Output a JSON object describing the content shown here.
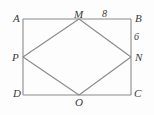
{
  "figure": {
    "kind": "geometry-diagram",
    "background_color": "#fdfdfd",
    "stroke_color": "#8a8a8a",
    "label_color": "#3a3a3a",
    "rectangle": {
      "name": "ABCD",
      "corners": [
        {
          "label": "A",
          "x": 23,
          "y": 19,
          "position": "top-left"
        },
        {
          "label": "B",
          "x": 131,
          "y": 19,
          "position": "top-right"
        },
        {
          "label": "C",
          "x": 131,
          "y": 95,
          "position": "bottom-right"
        },
        {
          "label": "D",
          "x": 23,
          "y": 95,
          "position": "bottom-left"
        }
      ]
    },
    "rhombus": {
      "name": "MNOP",
      "vertices": [
        {
          "label": "M",
          "x": 79,
          "y": 19,
          "on_side": "AB"
        },
        {
          "label": "N",
          "x": 131,
          "y": 57,
          "on_side": "BC"
        },
        {
          "label": "O",
          "x": 79,
          "y": 95,
          "on_side": "DC"
        },
        {
          "label": "P",
          "x": 23,
          "y": 57,
          "on_side": "AD"
        }
      ]
    },
    "measurements": [
      {
        "value": "8",
        "segment": "MB",
        "placement": "above-top-edge"
      },
      {
        "value": "6",
        "segment": "BN",
        "placement": "right-of-right-edge"
      }
    ]
  }
}
